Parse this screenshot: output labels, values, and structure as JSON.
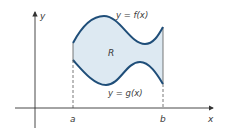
{
  "diagram": {
    "axes": {
      "x_label": "x",
      "y_label": "y"
    },
    "curves": {
      "top_label": "y = f(x)",
      "bottom_label": "y = g(x)"
    },
    "region_label": "R",
    "bounds": {
      "left": "a",
      "right": "b"
    },
    "colors": {
      "curve": "#1f4e79",
      "region_fill": "#dde9f2",
      "axis": "#333333",
      "text": "#3a3a3a"
    }
  }
}
